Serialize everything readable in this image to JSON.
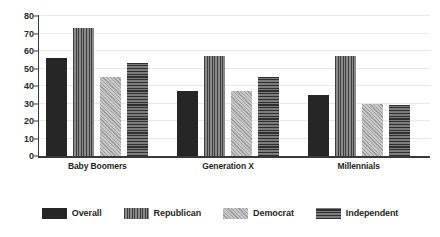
{
  "chart_data": {
    "type": "bar",
    "title": "",
    "xlabel": "",
    "ylabel": "",
    "ylim": [
      0,
      80
    ],
    "yticks": [
      0,
      10,
      20,
      30,
      40,
      50,
      60,
      70,
      80
    ],
    "ytick_labels": [
      "0",
      "10",
      "20",
      "30",
      "40",
      "50",
      "60",
      "70",
      "80"
    ],
    "grid": true,
    "legend_position": "bottom",
    "categories": [
      "Baby Boomers",
      "Generation X",
      "Millennials"
    ],
    "series": [
      {
        "name": "Overall",
        "values": [
          56,
          37,
          35
        ],
        "pattern": "solid",
        "color": "#262626"
      },
      {
        "name": "Republican",
        "values": [
          73,
          57,
          57
        ],
        "pattern": "vstripe",
        "color": "#6e6e6e"
      },
      {
        "name": "Democrat",
        "values": [
          45,
          37,
          30
        ],
        "pattern": "dots",
        "color": "#b4b4b4"
      },
      {
        "name": "Independent",
        "values": [
          53,
          45,
          29
        ],
        "pattern": "hstripe",
        "color": "#5a5a5a"
      }
    ]
  }
}
